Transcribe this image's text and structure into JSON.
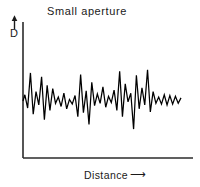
{
  "figure": {
    "title": "Small aperture",
    "y_axis_label": "D",
    "y_axis_arrow": "up-arrow",
    "x_axis_label": "Distance",
    "x_axis_arrow": "right-arrow",
    "line_color": "#000000",
    "axis_color": "#2b2b2b",
    "background_color": "#ffffff"
  },
  "chart_data": {
    "type": "line",
    "title": "Small aperture",
    "xlabel": "Distance",
    "ylabel": "D",
    "grid": false,
    "legend": null,
    "xlim": [
      0,
      170
    ],
    "ylim": [
      0,
      100
    ],
    "x": [
      0,
      2,
      5,
      8,
      11,
      14,
      17,
      20,
      23,
      26,
      29,
      32,
      35,
      38,
      41,
      44,
      47,
      50,
      53,
      56,
      59,
      62,
      65,
      68,
      71,
      74,
      77,
      80,
      83,
      86,
      89,
      92,
      95,
      98,
      101,
      104,
      107,
      110,
      113,
      116,
      119,
      122,
      125,
      128,
      131,
      134,
      137,
      140,
      143,
      146,
      149,
      152,
      155,
      158,
      161,
      164,
      167,
      170
    ],
    "values": [
      50,
      58,
      41,
      86,
      33,
      62,
      45,
      81,
      26,
      70,
      38,
      66,
      47,
      55,
      43,
      60,
      40,
      52,
      46,
      57,
      30,
      84,
      35,
      63,
      20,
      74,
      44,
      59,
      47,
      68,
      42,
      56,
      48,
      64,
      38,
      88,
      30,
      72,
      49,
      60,
      14,
      83,
      40,
      67,
      45,
      90,
      36,
      62,
      47,
      55,
      46,
      58,
      45,
      57,
      46,
      56,
      47,
      54
    ]
  }
}
